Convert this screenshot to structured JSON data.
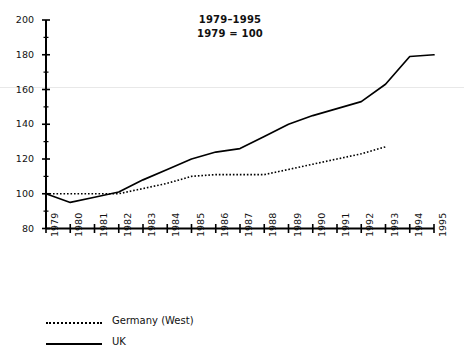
{
  "chart_data": {
    "type": "line",
    "title": "1979–1995",
    "subtitle": "1979 = 100",
    "xlabel": "",
    "ylabel": "",
    "ylim": [
      80,
      200
    ],
    "y_ticks": [
      80,
      100,
      120,
      140,
      160,
      180,
      200
    ],
    "y_minor_step": 10,
    "grid": false,
    "legend_position": "below-left",
    "x": [
      1979,
      1980,
      1981,
      1982,
      1983,
      1984,
      1985,
      1986,
      1987,
      1988,
      1989,
      1990,
      1991,
      1992,
      1993,
      1994,
      1995
    ],
    "categories": [
      "1979",
      "1980",
      "1981",
      "1982",
      "1983",
      "1984",
      "1985",
      "1986",
      "1987",
      "1988",
      "1989",
      "1990",
      "1991",
      "1992",
      "1993",
      "1994",
      "1995"
    ],
    "series": [
      {
        "name": "Germany (West)",
        "style": "dotted",
        "color": "#000000",
        "values": [
          100,
          100,
          100,
          100,
          103,
          106,
          110,
          111,
          111,
          111,
          114,
          117,
          120,
          123,
          127,
          null,
          null
        ]
      },
      {
        "name": "UK",
        "style": "solid",
        "color": "#000000",
        "values": [
          100,
          95,
          98,
          101,
          108,
          114,
          120,
          124,
          126,
          133,
          140,
          145,
          149,
          153,
          163,
          179,
          180
        ]
      }
    ]
  },
  "title": {
    "line1": "1979–1995",
    "line2": "1979 = 100"
  },
  "axes": {
    "y_tick_labels": [
      "200",
      "180",
      "160",
      "140",
      "120",
      "100",
      "80"
    ],
    "x_tick_labels": [
      "1979",
      "1980",
      "1981",
      "1982",
      "1983",
      "1984",
      "1985",
      "1986",
      "1987",
      "1988",
      "1989",
      "1990",
      "1991",
      "1992",
      "1993",
      "1994",
      "1995"
    ]
  },
  "legend": {
    "items": [
      {
        "label": "Germany (West)",
        "style": "dotted"
      },
      {
        "label": "UK",
        "style": "solid"
      }
    ]
  },
  "colors": {
    "ink": "#000000",
    "background": "#ffffff",
    "artifact_line": "#e6e6e6"
  }
}
